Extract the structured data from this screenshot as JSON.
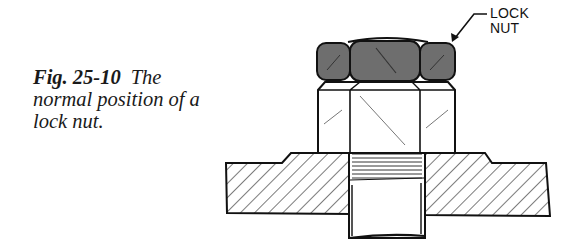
{
  "figure": {
    "number": "Fig. 25-10",
    "caption": "The normal position of a lock nut.",
    "caption_lines": [
      "The",
      "normal position of a",
      "lock nut."
    ]
  },
  "callout": {
    "line1": "LOCK",
    "line2": "NUT"
  },
  "colors": {
    "lock_nut_fill": "#6e6e6e",
    "outline": "#111111",
    "background": "#ffffff"
  }
}
